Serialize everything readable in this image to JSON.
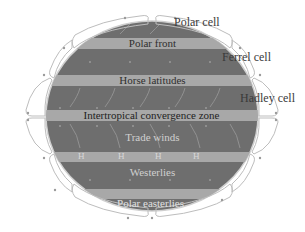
{
  "diagram": {
    "cell_labels": {
      "polar": "Polar cell",
      "ferrel": "Ferrel cell",
      "hadley": "Hadley cell"
    },
    "band_labels": {
      "polar_front": "Polar front",
      "horse_latitudes": "Horse latitudes",
      "itcz": "Intertropical convergence zone",
      "trade_winds": "Trade winds",
      "westerlies": "Westerlies",
      "polar_easterlies": "Polar easterlies"
    },
    "high_marker": "H",
    "colors": {
      "globe": "#6e6e6e",
      "band": "#a8a8a8",
      "cell_outline": "#bdbdbd",
      "dark_text": "#2f2f2f",
      "light_text": "#d8d8d8"
    }
  }
}
